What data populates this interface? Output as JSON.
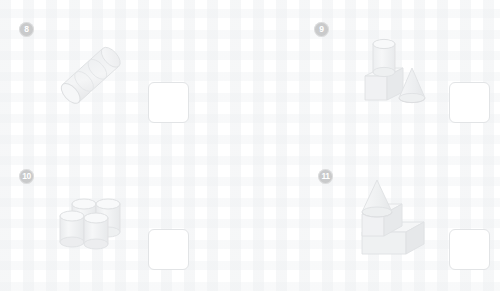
{
  "worksheet": {
    "title": "Solid figures counting worksheet",
    "background_color": "#ffffff",
    "badge_color": "#c9cacb",
    "badge_text_color": "#ffffff",
    "answer_box_border_color": "#e2e4e6",
    "shape_fill_color": "#f2f3f4",
    "shape_stroke_color": "#dfe1e3",
    "shape_shadow_color": "#e6e7e9"
  },
  "problems": [
    {
      "number": "8",
      "figure_name": "three-stacked-cylinders-diagonal",
      "figure_description": "Three identical cylinders joined end to end, lying on a diagonal going up to the right",
      "shapes": [
        {
          "type": "cylinder",
          "count": 3
        }
      ],
      "total_shapes": 3,
      "answer_value": ""
    },
    {
      "number": "9",
      "figure_name": "cylinder-on-cube-with-cone",
      "figure_description": "A cylinder standing on top of a cube, with a cone beside them on the right",
      "shapes": [
        {
          "type": "cylinder",
          "count": 1
        },
        {
          "type": "cube",
          "count": 1
        },
        {
          "type": "cone",
          "count": 1
        }
      ],
      "total_shapes": 3,
      "answer_value": ""
    },
    {
      "number": "10",
      "figure_name": "four-cylinders-cluster",
      "figure_description": "Four upright cylinders arranged in a two by two cluster",
      "shapes": [
        {
          "type": "cylinder",
          "count": 4
        }
      ],
      "total_shapes": 4,
      "answer_value": ""
    },
    {
      "number": "11",
      "figure_name": "cone-on-cube-on-rectangular-prism",
      "figure_description": "A cone resting on a cube, which sits on top of a wide rectangular prism forming a step shape",
      "shapes": [
        {
          "type": "cone",
          "count": 1
        },
        {
          "type": "cube",
          "count": 1
        },
        {
          "type": "rectangular-prism",
          "count": 1
        }
      ],
      "total_shapes": 3,
      "answer_value": ""
    }
  ]
}
